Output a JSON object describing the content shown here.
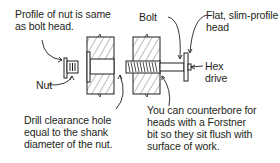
{
  "labels": {
    "profile": "Profile of nut is same\nas bolt head.",
    "nut": "Nut",
    "bolt": "Bolt",
    "flat_head": "Flat, slim-profile\nhead",
    "hex_drive": "Hex\ndrive",
    "drill": "Drill clearance hole\nequal to the shank\ndiameter of the nut.",
    "counterbore": "You can counterbore for\nheads with a Forstner\nbit so they sit flush with\nsurface of work."
  },
  "colors": {
    "line": "#231f20",
    "background": "#ffffff"
  }
}
